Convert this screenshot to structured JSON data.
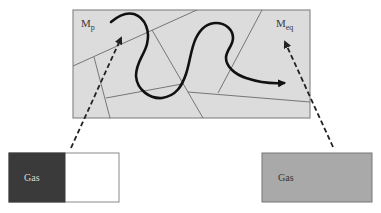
{
  "diagram": {
    "colors": {
      "region_fill": "#dcdcdc",
      "region_border": "#8a8a8a",
      "grain_boundary": "#6a6a6a",
      "path_stroke": "#111111",
      "dashed_arrow": "#222222",
      "left_box_gas_fill": "#3a3a3a",
      "left_box_empty_fill": "#ffffff",
      "right_box_fill": "#a9a9a9",
      "box_border": "#777777"
    },
    "points": {
      "start": {
        "label_main": "M",
        "label_sub": "p"
      },
      "end": {
        "label_main": "M",
        "label_sub": "eq"
      }
    },
    "boxes": {
      "left": {
        "label": "Gas",
        "state": "gas confined to left portion (non-equilibrium)"
      },
      "right": {
        "label": "Gas",
        "state": "gas filling entire box (equilibrium)"
      }
    }
  }
}
